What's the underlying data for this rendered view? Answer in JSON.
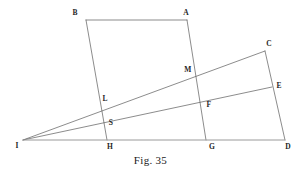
{
  "figure": {
    "caption": "Fig. 35",
    "caption_y": 154,
    "width": 301,
    "height": 171,
    "background_color": "#ffffff",
    "stroke_color": "#5a5a5a",
    "baseline_stroke_color": "#9a9a9a",
    "label_color": "#262626",
    "stroke_width": 0.7
  },
  "points": {
    "I": {
      "label": "I",
      "x": 23,
      "y": 140,
      "label_x": 17,
      "label_y": 146
    },
    "B": {
      "label": "B",
      "x": 86,
      "y": 20,
      "label_x": 75,
      "label_y": 13
    },
    "A": {
      "label": "A",
      "x": 187,
      "y": 20,
      "label_x": 186,
      "label_y": 13
    },
    "C": {
      "label": "C",
      "x": 265,
      "y": 51,
      "label_x": 269,
      "label_y": 44
    },
    "E": {
      "label": "E",
      "x": 272,
      "y": 87,
      "label_x": 279,
      "label_y": 86
    },
    "D": {
      "label": "D",
      "x": 285,
      "y": 140,
      "label_x": 288,
      "label_y": 147
    },
    "H": {
      "label": "H",
      "x": 107,
      "y": 140,
      "label_x": 110,
      "label_y": 147
    },
    "G": {
      "label": "G",
      "x": 206,
      "y": 140,
      "label_x": 212,
      "label_y": 147
    },
    "L": {
      "label": "L",
      "x": 104,
      "y": 103,
      "label_x": 105,
      "label_y": 99
    },
    "S": {
      "label": "S",
      "x": 107,
      "y": 119,
      "label_x": 111,
      "label_y": 123
    },
    "M": {
      "label": "M",
      "x": 192,
      "y": 73,
      "label_x": 188,
      "label_y": 70
    },
    "F": {
      "label": "F",
      "x": 205,
      "y": 100,
      "label_x": 209,
      "label_y": 105
    }
  },
  "segments": [
    {
      "name": "segment-B-A",
      "from": "B",
      "to": "A",
      "style": "solid"
    },
    {
      "name": "segment-B-H",
      "from": "B",
      "to": "H",
      "style": "solid"
    },
    {
      "name": "segment-A-G",
      "from": "A",
      "to": "G",
      "style": "solid"
    },
    {
      "name": "segment-I-C",
      "from": "I",
      "to": "C",
      "style": "solid"
    },
    {
      "name": "segment-I-E",
      "from": "I",
      "to": "E",
      "style": "solid"
    },
    {
      "name": "segment-C-D",
      "from": "C",
      "to": "D",
      "style": "solid"
    },
    {
      "name": "segment-I-D-baseline",
      "from": "I",
      "to": "D",
      "style": "baseline"
    }
  ],
  "labels_order": [
    "B",
    "A",
    "C",
    "M",
    "E",
    "L",
    "F",
    "S",
    "I",
    "H",
    "G",
    "D"
  ]
}
